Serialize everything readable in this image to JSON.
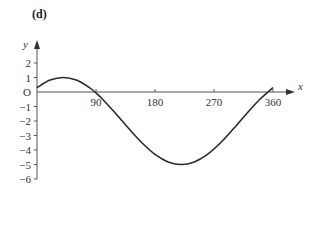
{
  "panel_label": "(d)",
  "chart_data": {
    "type": "line",
    "title": "(d)",
    "xlabel": "x",
    "ylabel": "y",
    "origin_label": "O",
    "x_ticks": [
      90,
      180,
      270,
      360
    ],
    "y_ticks": [
      2,
      1,
      -1,
      -2,
      -3,
      -4,
      -5,
      -6
    ],
    "xlim": [
      0,
      370
    ],
    "ylim": [
      -6,
      2.5
    ],
    "grid": false,
    "legend": null,
    "function_description": "y = -2 + 3cos(x - 40°)",
    "series": [
      {
        "name": "curve",
        "x": [
          0,
          20,
          40,
          60,
          80,
          90,
          100,
          120,
          140,
          160,
          180,
          200,
          220,
          240,
          260,
          280,
          300,
          320,
          340,
          360
        ],
        "y": [
          0.3,
          0.82,
          1.0,
          0.82,
          0.3,
          -0.07,
          -0.5,
          -1.48,
          -2.52,
          -3.5,
          -4.3,
          -4.82,
          -5.0,
          -4.82,
          -4.3,
          -3.5,
          -2.52,
          -1.48,
          -0.5,
          0.3
        ]
      }
    ]
  }
}
